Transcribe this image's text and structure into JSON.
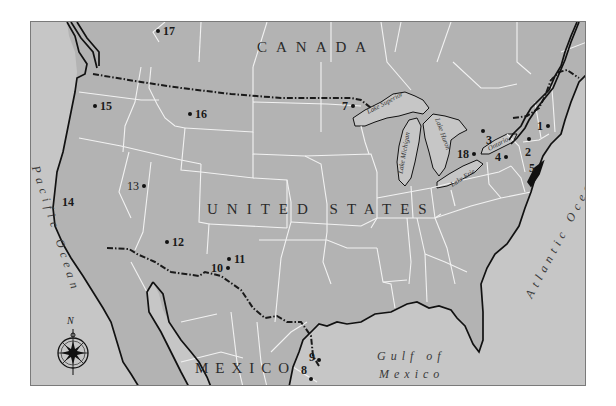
{
  "map": {
    "colors": {
      "land": "#b3b3b3",
      "water": "#c6c6c6",
      "coastline": "#111111",
      "state_border": "#f2f2f2",
      "national_border": "#1a1a1a",
      "frame": "#7a7a7a"
    },
    "region_labels": {
      "canada": "CANADA",
      "united_states": "UNITED STATES",
      "mexico": "MEXICO"
    },
    "water_labels": {
      "pacific": "Pacific Ocean",
      "atlantic": "Atlantic Ocean",
      "gulf_line1": "Gulf of",
      "gulf_line2": "Mexico"
    },
    "lakes": {
      "superior": "Lake Superior",
      "michigan": "Lake Michigan",
      "huron": "Lake Huron",
      "erie": "Lake Erie",
      "ontario": "Ontario"
    },
    "compass": {
      "north_label": "N"
    },
    "markers": [
      {
        "id": "1",
        "label": "1"
      },
      {
        "id": "2",
        "label": "2"
      },
      {
        "id": "3",
        "label": "3"
      },
      {
        "id": "4",
        "label": "4"
      },
      {
        "id": "5",
        "label": "5"
      },
      {
        "id": "7",
        "label": "7"
      },
      {
        "id": "8",
        "label": "8"
      },
      {
        "id": "9",
        "label": "9"
      },
      {
        "id": "10",
        "label": "10"
      },
      {
        "id": "11",
        "label": "11"
      },
      {
        "id": "12",
        "label": "12"
      },
      {
        "id": "13",
        "label": "13"
      },
      {
        "id": "14",
        "label": "14"
      },
      {
        "id": "15",
        "label": "15"
      },
      {
        "id": "16",
        "label": "16"
      },
      {
        "id": "17",
        "label": "17"
      },
      {
        "id": "18",
        "label": "18"
      }
    ]
  }
}
